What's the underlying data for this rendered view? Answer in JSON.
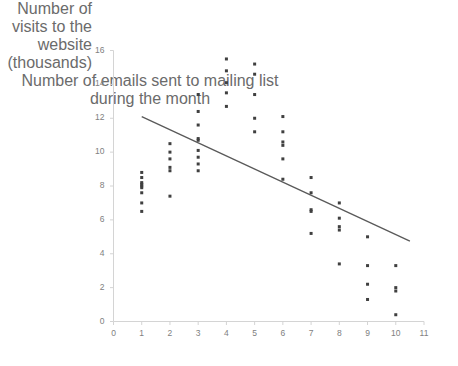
{
  "chart_data": {
    "type": "scatter",
    "title": "",
    "ylabel": "Number of visits to the website (thousands)",
    "xlabel": "Number of emails sent to mailing list during the month",
    "xlim": [
      0,
      11
    ],
    "ylim": [
      0,
      16
    ],
    "xticks": [
      0,
      1,
      2,
      3,
      4,
      5,
      6,
      7,
      8,
      9,
      10,
      11
    ],
    "yticks": [
      0,
      2,
      4,
      6,
      8,
      10,
      12,
      14,
      16
    ],
    "grid": false,
    "legend": null,
    "marker_color": "#404040",
    "marker_size": 3,
    "points": [
      [
        1,
        8.8
      ],
      [
        1,
        8.5
      ],
      [
        1,
        8.2
      ],
      [
        1,
        8.1
      ],
      [
        1,
        8.0
      ],
      [
        1,
        7.9
      ],
      [
        1,
        7.6
      ],
      [
        1,
        7.0
      ],
      [
        1,
        6.5
      ],
      [
        2,
        10.5
      ],
      [
        2,
        10.0
      ],
      [
        2,
        9.6
      ],
      [
        2,
        9.1
      ],
      [
        2,
        8.9
      ],
      [
        2,
        7.4
      ],
      [
        3,
        13.4
      ],
      [
        3,
        12.4
      ],
      [
        3,
        11.6
      ],
      [
        3,
        10.8
      ],
      [
        3,
        10.7
      ],
      [
        3,
        10.1
      ],
      [
        3,
        9.7
      ],
      [
        3,
        9.3
      ],
      [
        3,
        8.9
      ],
      [
        4,
        15.5
      ],
      [
        4,
        14.8
      ],
      [
        4,
        14.1
      ],
      [
        4,
        13.5
      ],
      [
        4,
        12.7
      ],
      [
        5,
        15.2
      ],
      [
        5,
        14.6
      ],
      [
        5,
        13.4
      ],
      [
        5,
        12.0
      ],
      [
        5,
        11.2
      ],
      [
        6,
        12.1
      ],
      [
        6,
        11.2
      ],
      [
        6,
        10.6
      ],
      [
        6,
        10.4
      ],
      [
        6,
        9.6
      ],
      [
        6,
        8.4
      ],
      [
        7,
        8.5
      ],
      [
        7,
        7.6
      ],
      [
        7,
        6.6
      ],
      [
        7,
        6.5
      ],
      [
        7,
        5.2
      ],
      [
        8,
        7.0
      ],
      [
        8,
        6.1
      ],
      [
        8,
        5.6
      ],
      [
        8,
        5.4
      ],
      [
        8,
        3.4
      ],
      [
        9,
        5.0
      ],
      [
        9,
        3.3
      ],
      [
        9,
        2.2
      ],
      [
        9,
        1.3
      ],
      [
        10,
        3.3
      ],
      [
        10,
        2.0
      ],
      [
        10,
        1.8
      ],
      [
        10,
        0.4
      ]
    ],
    "trendline": {
      "type": "line",
      "color": "#595959",
      "x": [
        1,
        10.5
      ],
      "y": [
        12.1,
        4.75
      ]
    }
  }
}
